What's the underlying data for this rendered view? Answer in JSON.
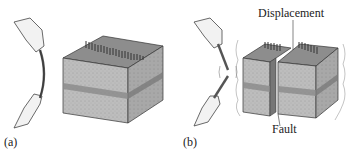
{
  "panels": [
    {
      "id": "a",
      "label": "(a)"
    },
    {
      "id": "b",
      "label": "(b)"
    }
  ],
  "annotations": {
    "displacement": "Displacement",
    "fault": "Fault"
  },
  "colors": {
    "block_top": "#8a8a8a",
    "block_front": "#b9b9b9",
    "block_side": "#a5a5a5",
    "stripe": "#7d7d7d",
    "outline": "#333333"
  }
}
